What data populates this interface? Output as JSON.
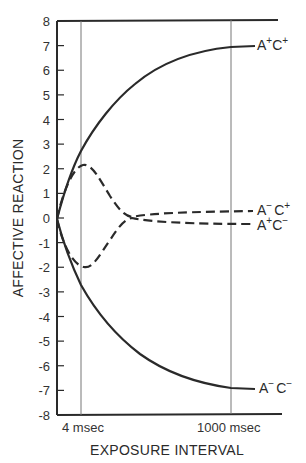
{
  "chart_data": {
    "type": "line",
    "title": "",
    "xlabel": "EXPOSURE INTERVAL",
    "ylabel": "AFFECTIVE REACTION",
    "ylim": [
      -8,
      8
    ],
    "yticks": [
      8,
      7,
      6,
      5,
      4,
      3,
      2,
      1,
      0,
      -1,
      -2,
      -3,
      -4,
      -5,
      -6,
      -7,
      -8
    ],
    "x_markers": [
      {
        "label": "4 msec",
        "position": "early"
      },
      {
        "label": "1000 msec",
        "position": "late"
      }
    ],
    "grid": false,
    "legend_position": "inline-right",
    "x_relative": [
      0.0,
      0.05,
      0.1,
      0.2,
      0.3,
      0.4,
      0.5,
      0.6,
      0.7,
      0.8,
      0.9,
      1.0,
      1.1
    ],
    "series": [
      {
        "name": "A+C+",
        "label_main": [
          "A",
          "C"
        ],
        "label_sup": [
          "+",
          "+"
        ],
        "style": "solid",
        "values": [
          0,
          1.3,
          2.6,
          4.1,
          5.2,
          5.9,
          6.3,
          6.6,
          6.75,
          6.85,
          6.9,
          6.95,
          7.0
        ]
      },
      {
        "name": "A-C+",
        "label_main": [
          "A",
          "C"
        ],
        "label_sup": [
          "−",
          "+"
        ],
        "style": "dashed",
        "values": [
          0,
          1.6,
          2.1,
          1.0,
          0.3,
          0.15,
          0.18,
          0.2,
          0.22,
          0.23,
          0.24,
          0.25,
          0.25
        ]
      },
      {
        "name": "A+C-",
        "label_main": [
          "A",
          "C"
        ],
        "label_sup": [
          "+",
          "−"
        ],
        "style": "dashed",
        "values": [
          0,
          -1.6,
          -2.0,
          -0.9,
          -0.1,
          -0.2,
          -0.23,
          -0.25,
          -0.27,
          -0.28,
          -0.29,
          -0.3,
          -0.3
        ]
      },
      {
        "name": "A-C-",
        "label_main": [
          "A",
          "C"
        ],
        "label_sup": [
          "−",
          "−"
        ],
        "style": "solid",
        "values": [
          0,
          -1.3,
          -2.6,
          -3.9,
          -4.9,
          -5.6,
          -6.1,
          -6.45,
          -6.65,
          -6.8,
          -6.9,
          -6.95,
          -7.0
        ]
      }
    ]
  },
  "axis": {
    "ylabel": "AFFECTIVE REACTION",
    "xlabel": "EXPOSURE INTERVAL",
    "tick_4msec": "4 msec",
    "tick_1000msec": "1000 msec"
  },
  "labels": {
    "apcp": {
      "a": "A",
      "s1": "+",
      "c": "C",
      "s2": "+"
    },
    "amcp": {
      "a": "A",
      "s1": "−",
      "c": "C",
      "s2": "+"
    },
    "apcm": {
      "a": "A",
      "s1": "+",
      "c": "C",
      "s2": "−"
    },
    "amcm": {
      "a": "A",
      "s1": "−",
      "c": "C",
      "s2": "−"
    }
  },
  "colors": {
    "ink": "#2a2a2a",
    "thin_line": "#666666",
    "background": "#ffffff"
  }
}
